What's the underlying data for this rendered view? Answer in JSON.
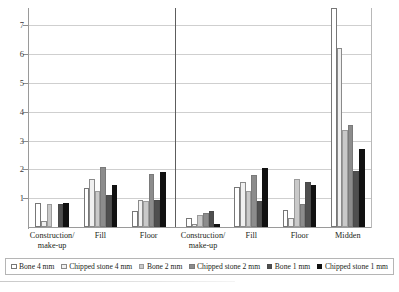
{
  "chart_data": {
    "type": "bar",
    "title": "",
    "xlabel": "",
    "ylabel": "",
    "ylim": [
      0,
      7.6
    ],
    "yticks": [
      1,
      2,
      3,
      4,
      5,
      6,
      7
    ],
    "grid": true,
    "legend_position": "bottom",
    "categories": [
      "Construction/\nmake-up",
      "Fill",
      "Floor",
      "Construction/\nmake-up",
      "Fill",
      "Floor",
      "Midden"
    ],
    "group_divider_after_category_index": 2,
    "series": [
      {
        "name": "Bone 4 mm",
        "color": "#ffffff",
        "values": [
          0.85,
          1.35,
          0.55,
          0.3,
          1.4,
          0.6,
          7.6
        ]
      },
      {
        "name": "Chipped stone 4 mm",
        "color": "#f0f0f0",
        "values": [
          0.2,
          1.65,
          0.95,
          0.12,
          1.55,
          0.3,
          6.2
        ]
      },
      {
        "name": "Bone 2 mm",
        "color": "#c9c9c9",
        "values": [
          0.8,
          1.25,
          0.9,
          0.4,
          1.25,
          1.65,
          3.35
        ]
      },
      {
        "name": "Chipped stone 2 mm",
        "color": "#8c8c8c",
        "values": [
          0.0,
          2.1,
          1.85,
          0.5,
          1.8,
          0.8,
          3.55
        ]
      },
      {
        "name": "Bone 1 mm",
        "color": "#4f4f4f",
        "values": [
          0.8,
          1.1,
          0.95,
          0.55,
          0.9,
          1.55,
          1.95
        ]
      },
      {
        "name": "Chipped stone 1 mm",
        "color": "#111111",
        "values": [
          0.85,
          1.45,
          1.9,
          0.12,
          2.05,
          1.45,
          2.7
        ]
      }
    ]
  },
  "legend": {
    "items": [
      {
        "label": "Bone 4 mm"
      },
      {
        "label": "Chipped stone 4 mm"
      },
      {
        "label": "Bone 2 mm"
      },
      {
        "label": "Chipped stone 2 mm"
      },
      {
        "label": "Bone 1 mm"
      },
      {
        "label": "Chipped stone 1 mm"
      }
    ]
  }
}
